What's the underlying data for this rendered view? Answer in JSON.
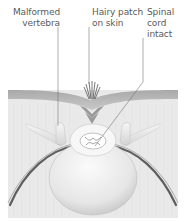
{
  "diagram": {
    "labels": [
      {
        "id": "malformed-vertebra",
        "lines": [
          "Malformed",
          "vertebra"
        ]
      },
      {
        "id": "hairy-patch",
        "lines": [
          "Hairy patch",
          "on skin"
        ]
      },
      {
        "id": "spinal-cord",
        "lines": [
          "Spinal",
          "cord",
          "intact"
        ]
      }
    ],
    "colors": {
      "background": "#ffffff",
      "tissue": "#e8e8e8",
      "skin": "#b8b8b8",
      "bone": "#f4f4f4",
      "nerve": "#6a6a6a",
      "leader_line": "#777777",
      "text": "#5a5a5a"
    }
  }
}
